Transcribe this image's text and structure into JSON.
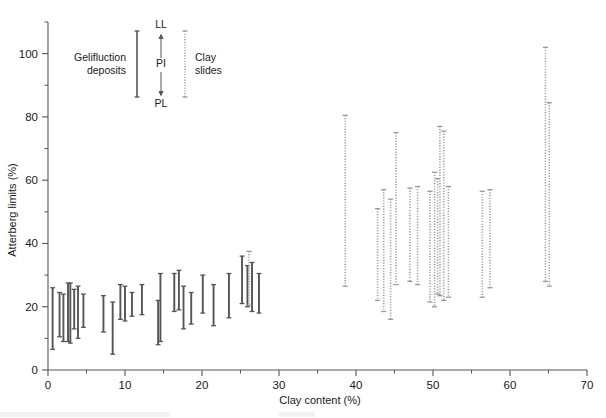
{
  "figure": {
    "background": "#ffffff",
    "ink": "#1a1a1a",
    "solid_color": "#555555",
    "dotted_color": "#9a9a9a"
  },
  "axes": {
    "y": {
      "label": "Atterberg limits (%)",
      "min": 0,
      "max": 110,
      "major_ticks": [
        0,
        20,
        40,
        60,
        80,
        100
      ],
      "major_tick_labels": [
        "0",
        "20",
        "40",
        "60",
        "80",
        "100"
      ],
      "minor_ticks": [
        10,
        30,
        50,
        70,
        90,
        110
      ]
    },
    "x": {
      "label": "Clay content (%)",
      "min": 0,
      "max": 70,
      "major_ticks": [
        0,
        10,
        20,
        30,
        40,
        50,
        60,
        70
      ],
      "major_tick_labels": [
        "0",
        "10",
        "20",
        "30",
        "40",
        "50",
        "60",
        "70"
      ],
      "minor_ticks": [
        5,
        15,
        25,
        35,
        45,
        55,
        65
      ]
    }
  },
  "legend": {
    "position": "top-center",
    "left_label_line1": "Gelifluction",
    "left_label_line2": "deposits",
    "right_label_line1": "Clay",
    "right_label_line2": "slides",
    "ll_label": "LL",
    "pi_label": "PI",
    "pl_label": "PL",
    "left_bar_style": "solid",
    "right_bar_style": "dotted"
  },
  "chart_data": {
    "type": "scatter",
    "title": "",
    "xlabel": "Clay content (%)",
    "ylabel": "Atterberg limits (%)",
    "xlim": [
      0,
      70
    ],
    "ylim": [
      0,
      110
    ],
    "grid": false,
    "legend_position": "top-center",
    "series": [
      {
        "name": "Gelifluction deposits",
        "style": "solid",
        "color": "#555555",
        "marker": "vertical-range-bar",
        "notes": "Each bar spans plastic limit (PL, lower cap) to liquid limit (LL, upper cap); bar length is the plasticity index (PI).",
        "points": [
          {
            "x": 0.6,
            "pl": 6.5,
            "ll": 26.0
          },
          {
            "x": 1.5,
            "pl": 10.5,
            "ll": 24.5
          },
          {
            "x": 2.0,
            "pl": 9.0,
            "ll": 24.0
          },
          {
            "x": 2.6,
            "pl": 9.0,
            "ll": 27.5
          },
          {
            "x": 2.9,
            "pl": 8.5,
            "ll": 27.5
          },
          {
            "x": 3.4,
            "pl": 13.0,
            "ll": 25.5
          },
          {
            "x": 3.9,
            "pl": 10.0,
            "ll": 26.5
          },
          {
            "x": 4.6,
            "pl": 13.5,
            "ll": 24.0
          },
          {
            "x": 7.2,
            "pl": 12.0,
            "ll": 23.5
          },
          {
            "x": 8.4,
            "pl": 5.0,
            "ll": 21.5
          },
          {
            "x": 9.4,
            "pl": 16.0,
            "ll": 27.0
          },
          {
            "x": 10.0,
            "pl": 15.5,
            "ll": 26.5
          },
          {
            "x": 10.9,
            "pl": 17.0,
            "ll": 24.5
          },
          {
            "x": 12.2,
            "pl": 17.5,
            "ll": 27.0
          },
          {
            "x": 14.3,
            "pl": 8.0,
            "ll": 22.0
          },
          {
            "x": 14.6,
            "pl": 9.0,
            "ll": 30.5
          },
          {
            "x": 16.4,
            "pl": 18.5,
            "ll": 30.5
          },
          {
            "x": 17.0,
            "pl": 19.0,
            "ll": 31.5
          },
          {
            "x": 17.6,
            "pl": 13.0,
            "ll": 26.5
          },
          {
            "x": 18.6,
            "pl": 14.5,
            "ll": 24.5
          },
          {
            "x": 20.1,
            "pl": 18.0,
            "ll": 30.0
          },
          {
            "x": 21.5,
            "pl": 14.0,
            "ll": 27.0
          },
          {
            "x": 23.5,
            "pl": 16.5,
            "ll": 30.5
          },
          {
            "x": 25.2,
            "pl": 21.0,
            "ll": 36.0
          },
          {
            "x": 25.9,
            "pl": 20.0,
            "ll": 33.0
          },
          {
            "x": 26.5,
            "pl": 18.5,
            "ll": 34.0
          },
          {
            "x": 27.4,
            "pl": 18.0,
            "ll": 30.5
          }
        ]
      },
      {
        "name": "Clay slides",
        "style": "dotted",
        "color": "#9a9a9a",
        "marker": "vertical-range-bar",
        "notes": "Each bar spans plastic limit (PL, lower cap) to liquid limit (LL, upper cap); bar length is the plasticity index (PI).",
        "points": [
          {
            "x": 26.1,
            "pl": 20.5,
            "ll": 37.5
          },
          {
            "x": 38.6,
            "pl": 26.5,
            "ll": 80.5
          },
          {
            "x": 42.8,
            "pl": 22.0,
            "ll": 51.0
          },
          {
            "x": 43.6,
            "pl": 18.5,
            "ll": 57.0
          },
          {
            "x": 44.5,
            "pl": 16.0,
            "ll": 54.0
          },
          {
            "x": 45.2,
            "pl": 27.0,
            "ll": 75.0
          },
          {
            "x": 47.0,
            "pl": 28.0,
            "ll": 57.5
          },
          {
            "x": 48.0,
            "pl": 27.0,
            "ll": 58.0
          },
          {
            "x": 49.6,
            "pl": 21.5,
            "ll": 56.5
          },
          {
            "x": 50.2,
            "pl": 20.0,
            "ll": 62.5
          },
          {
            "x": 50.6,
            "pl": 24.0,
            "ll": 60.5
          },
          {
            "x": 50.9,
            "pl": 23.5,
            "ll": 77.0
          },
          {
            "x": 51.4,
            "pl": 22.0,
            "ll": 75.5
          },
          {
            "x": 52.0,
            "pl": 23.0,
            "ll": 58.0
          },
          {
            "x": 56.4,
            "pl": 23.0,
            "ll": 56.5
          },
          {
            "x": 57.4,
            "pl": 26.0,
            "ll": 57.0
          },
          {
            "x": 64.6,
            "pl": 28.0,
            "ll": 102.0
          },
          {
            "x": 65.1,
            "pl": 26.5,
            "ll": 84.5
          }
        ]
      }
    ]
  }
}
